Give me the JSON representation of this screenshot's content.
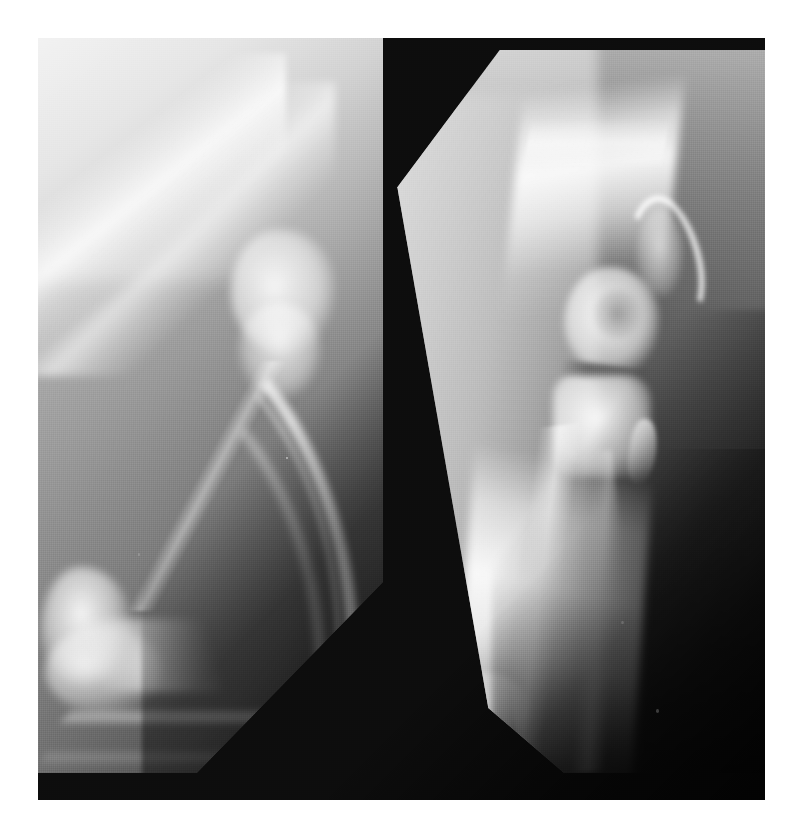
{
  "figure": {
    "kind": "radiograph-figure",
    "modality": "X-ray (plain radiograph)",
    "caption": "",
    "panel_count": 2,
    "background_color": "#0d0d0d",
    "page_background": "#ffffff",
    "plate": {
      "left": 38,
      "top": 38,
      "width": 727,
      "height": 762
    },
    "panels": [
      {
        "id": "radiograph-left",
        "position": "left",
        "label": "",
        "view": "mediolateral (lateral) projection",
        "anatomy": "elbow joint with humerus, radius and ulna",
        "exposure": "overexposed / light, bright upper-left falling to dark lower-right",
        "film_shape": "rectangle with diagonally cropped lower-right corner",
        "tone_range": [
          "#f2f2f2",
          "#2a2a2a"
        ],
        "features": [
          "proximal bone shaft entering from upper-left corner",
          "joint region mid-right, washed out",
          "long curved distal bone sweeping to lower-left",
          "bright distal articular cluster at lower-left",
          "dark collimation wedge across lower-right"
        ]
      },
      {
        "id": "radiograph-right",
        "position": "right",
        "label": "",
        "view": "mediolateral (lateral) projection",
        "anatomy": "elbow joint with distal humerus, olecranon and proximal radius/ulna",
        "exposure": "better contrast, mid-grey soft tissue with bright cortical bone",
        "film_shape": "tilted film with cut upper-left corner and pointed V lower edge",
        "tone_range": [
          "#d8d8d8",
          "#464646"
        ],
        "features": [
          "humeral shaft descending from top with bright cortices",
          "humeral condyle with visible trochlear notch",
          "hook-shaped olecranon projecting up and to the right",
          "narrow radiolucent joint space",
          "proximal ulna block below the joint",
          "long distal bone shaft angling down and left to a bright tip",
          "dark collimation triangle lower-right"
        ]
      }
    ],
    "colors": {
      "plate": "#0d0d0d",
      "page": "#ffffff",
      "left_film_highlight": "#f2f2f2",
      "left_film_shadow": "#2a2a2a",
      "right_film_highlight": "#d8d8d8",
      "right_film_shadow": "#464646",
      "bone_white": "#ffffff"
    }
  }
}
